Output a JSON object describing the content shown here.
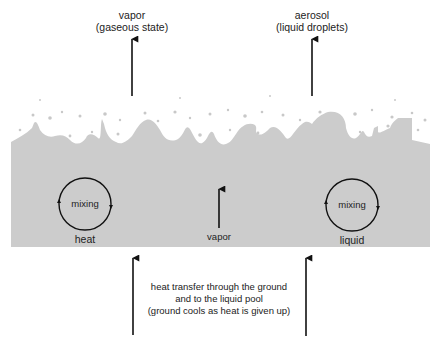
{
  "diagram": {
    "type": "liquid-pool-evaporation",
    "colors": {
      "pool_fill": "#cccccc",
      "droplets": "#c8c8c8",
      "arrows": "#111111",
      "background": "#ffffff"
    },
    "top_labels": {
      "vapor": {
        "line1": "vapor",
        "line2": "(gaseous state)"
      },
      "aerosol": {
        "line1": "aerosol",
        "line2": "(liquid droplets)"
      }
    },
    "pool": {
      "left_circle": {
        "inner_label": "mixing",
        "below_label": "heat"
      },
      "center_arrow_label": "vapor",
      "right_circle": {
        "inner_label": "mixing",
        "below_label": "liquid"
      }
    },
    "ground": {
      "line1": "heat transfer through the ground",
      "line2": "and to the liquid pool",
      "line3": "(ground cools as heat is given up)"
    }
  }
}
